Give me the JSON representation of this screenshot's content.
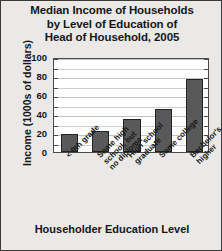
{
  "chart_data": {
    "type": "bar",
    "title": "Median Income of Households by Level of Education of Head of Household, 2005",
    "title_lines": [
      "Median Income of Households",
      "by Level of Education of",
      "Head of Household, 2005"
    ],
    "xlabel": "Householder Education Level",
    "ylabel": "Income (1000s of dollars)",
    "categories": [
      "< 9th grade",
      "Some high school, but no diploma",
      "High school graduate",
      "Some college",
      "Bachelor's or higher"
    ],
    "category_lines": [
      [
        "< 9th grade"
      ],
      [
        "Some high",
        "school, but",
        "no diploma"
      ],
      [
        "High school",
        "graduate"
      ],
      [
        "Some college"
      ],
      [
        "Bachelor's or",
        "higher"
      ]
    ],
    "values": [
      19,
      22,
      35,
      45,
      77
    ],
    "ylim": [
      0,
      100
    ],
    "ytick_labels": [
      "0",
      "20",
      "40",
      "60",
      "80",
      "100"
    ],
    "ytick_values": [
      0,
      20,
      40,
      60,
      80,
      100
    ],
    "gridline_values": [
      10,
      20,
      30,
      40,
      50,
      60,
      70,
      80,
      90,
      100
    ],
    "grid": true,
    "legend": "none",
    "bar_color": "#595959",
    "bar_edge_color": "#232323",
    "plot_background": "#ffffff",
    "figure_background": "#eae9e7"
  }
}
